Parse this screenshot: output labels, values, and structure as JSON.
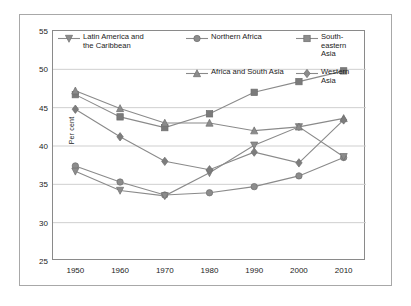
{
  "chart_data": {
    "type": "line",
    "title": "",
    "subtitle": "",
    "xlabel": "",
    "ylabel": "Per cent",
    "x": [
      1950,
      1960,
      1970,
      1980,
      1990,
      2000,
      2010
    ],
    "xticklabels": [
      "1950",
      "1960",
      "1970",
      "1980",
      "1990",
      "2000",
      "2010"
    ],
    "yticklabels": [
      "25",
      "30",
      "35",
      "40",
      "45",
      "50",
      "55"
    ],
    "yticks": [
      25,
      30,
      35,
      40,
      45,
      50,
      55
    ],
    "xlim": [
      1945,
      2015
    ],
    "ylim": [
      25,
      55
    ],
    "grid": "horizontal",
    "legend_position": "top-inside",
    "series": [
      {
        "name": "Northern Africa",
        "marker": "circle",
        "color": "#8c8c8c",
        "values": [
          37.4,
          35.3,
          33.6,
          33.9,
          34.7,
          36.1,
          38.5
        ]
      },
      {
        "name": "South-eastern Asia",
        "marker": "square",
        "color": "#7a7a7a",
        "values": [
          46.7,
          43.8,
          42.4,
          44.2,
          47.0,
          48.4,
          49.8
        ]
      },
      {
        "name": "Latin America and\nthe Caribbean",
        "marker": "triangle-down",
        "color": "#8c8c8c",
        "values": [
          36.7,
          34.2,
          33.5,
          36.5,
          40.1,
          42.5,
          38.6
        ]
      },
      {
        "name": "Africa and South Asia",
        "marker": "triangle-up",
        "color": "#8c8c8c",
        "values": [
          47.2,
          44.9,
          43.0,
          43.0,
          42.0,
          42.5,
          43.6
        ]
      },
      {
        "name": "Western Asia",
        "marker": "diamond",
        "color": "#7d7d7d",
        "values": [
          44.8,
          41.2,
          38.0,
          36.9,
          39.2,
          37.8,
          43.4
        ]
      }
    ]
  },
  "legend": {
    "items": [
      {
        "label": "Northern Africa",
        "marker": "circle"
      },
      {
        "label": "South-eastern  Asia",
        "marker": "square"
      },
      {
        "label": "Latin America and\nthe Caribbean",
        "marker": "triangle-down"
      },
      {
        "label": "Africa and South Asia",
        "marker": "triangle-up"
      },
      {
        "label": "Western  Asia",
        "marker": "diamond"
      }
    ]
  },
  "axis": {
    "y_label": "Per cent"
  },
  "colors": {
    "line": "#8a8a8a",
    "grid": "#cfcfcf",
    "frame": "#a8a8a8",
    "text": "#1b1b1b"
  }
}
